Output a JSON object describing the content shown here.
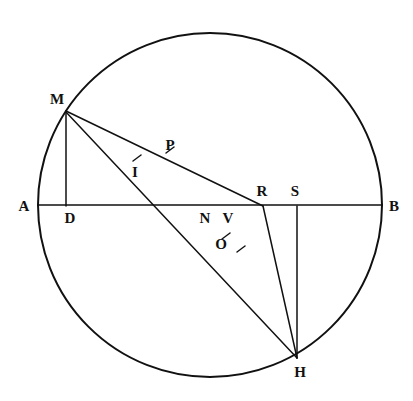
{
  "figure": {
    "background_color": "#ffffff",
    "stroke_color": "#111111",
    "canvas": {
      "width": 413,
      "height": 401
    }
  },
  "circle": {
    "center_x": 210,
    "center_y": 205,
    "radius": 172,
    "stroke_width": 2.0
  },
  "points": [
    {
      "id": "A",
      "label": "A",
      "x": 38,
      "y": 205,
      "label_x": 24,
      "label_y": 206
    },
    {
      "id": "B",
      "label": "B",
      "x": 382,
      "y": 205,
      "label_x": 394,
      "label_y": 206
    },
    {
      "id": "M",
      "label": "M",
      "x": 66,
      "y": 111,
      "label_x": 57,
      "label_y": 99
    },
    {
      "id": "D",
      "label": "D",
      "x": 66,
      "y": 205,
      "label_x": 70,
      "label_y": 218
    },
    {
      "id": "N",
      "label": "N",
      "x": 218,
      "y": 205,
      "label_x": 205,
      "label_y": 218
    },
    {
      "id": "V",
      "label": "V",
      "x": 226,
      "y": 228,
      "label_x": 228,
      "label_y": 218
    },
    {
      "id": "O",
      "label": "O",
      "x": 236,
      "y": 247,
      "label_x": 221,
      "label_y": 244
    },
    {
      "id": "I",
      "label": "I",
      "x": 137,
      "y": 158,
      "label_x": 135,
      "label_y": 172
    },
    {
      "id": "P",
      "label": "P",
      "x": 170,
      "y": 150,
      "label_x": 170,
      "label_y": 145
    },
    {
      "id": "R",
      "label": "R",
      "x": 263,
      "y": 205,
      "label_x": 262,
      "label_y": 191
    },
    {
      "id": "S",
      "label": "S",
      "x": 297,
      "y": 205,
      "label_x": 295,
      "label_y": 191
    },
    {
      "id": "H",
      "label": "H",
      "x": 297,
      "y": 358,
      "label_x": 300,
      "label_y": 372
    }
  ],
  "segments": [
    {
      "id": "AB",
      "from": "A",
      "to": "B",
      "x1": 38,
      "y1": 205,
      "x2": 382,
      "y2": 205,
      "stroke_width": 1.6
    },
    {
      "id": "MD",
      "from": "M",
      "to": "D",
      "x1": 66,
      "y1": 111,
      "x2": 66,
      "y2": 206,
      "stroke_width": 1.5
    },
    {
      "id": "MR",
      "from": "M",
      "to": "R",
      "x1": 66,
      "y1": 111,
      "x2": 263,
      "y2": 206,
      "stroke_width": 1.5
    },
    {
      "id": "MO",
      "from": "M",
      "to": "O",
      "x1": 66,
      "y1": 112,
      "x2": 246,
      "y2": 268,
      "stroke_width": 1.5
    },
    {
      "id": "OH",
      "from": "O",
      "to": "H",
      "x1": 246,
      "y1": 268,
      "x2": 297,
      "y2": 358,
      "stroke_width": 1.5
    },
    {
      "id": "RH",
      "from": "R",
      "to": "H",
      "x1": 263,
      "y1": 206,
      "x2": 297,
      "y2": 358,
      "stroke_width": 1.5
    },
    {
      "id": "SH",
      "from": "S",
      "to": "H",
      "x1": 297,
      "y1": 206,
      "x2": 297,
      "y2": 358,
      "stroke_width": 1.5
    }
  ],
  "tick_marks": [
    {
      "id": "tick-I",
      "on_segment": "MO",
      "x": 137,
      "y": 158,
      "angle_deg": 60
    },
    {
      "id": "tick-P",
      "on_segment": "MR",
      "x": 170,
      "y": 150,
      "angle_deg": 60
    },
    {
      "id": "tick-V",
      "on_segment": "MO",
      "x": 226,
      "y": 236,
      "angle_deg": 60
    },
    {
      "id": "tick-O",
      "on_segment": "MO",
      "x": 241,
      "y": 249,
      "angle_deg": 60
    }
  ]
}
